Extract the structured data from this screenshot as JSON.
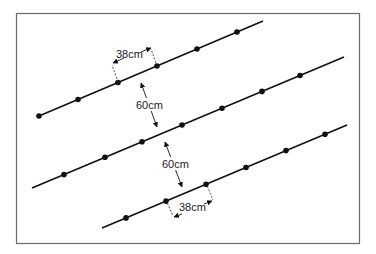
{
  "diagram": {
    "frame": {
      "x": 16,
      "y": 13,
      "w": 343,
      "h": 230,
      "color": "#6a6a6a"
    },
    "line_color": "#111111",
    "rows": [
      {
        "name": "row-top",
        "start": [
          39,
          116
        ],
        "end": [
          263,
          21
        ],
        "plants_x": [
          39,
          78,
          118,
          157,
          197,
          237
        ]
      },
      {
        "name": "row-middle",
        "start": [
          32,
          188
        ],
        "end": [
          344,
          57
        ],
        "plants_x": [
          64,
          105,
          142,
          182,
          222,
          262,
          300
        ]
      },
      {
        "name": "row-bottom",
        "start": [
          102,
          228
        ],
        "end": [
          347,
          125
        ],
        "plants_x": [
          126,
          166,
          206,
          246,
          286,
          325
        ]
      }
    ],
    "labels": {
      "plant_spacing_top": "38cm",
      "row_spacing_upper": "60cm",
      "row_spacing_lower": "60cm",
      "plant_spacing_bottom": "38cm"
    }
  }
}
